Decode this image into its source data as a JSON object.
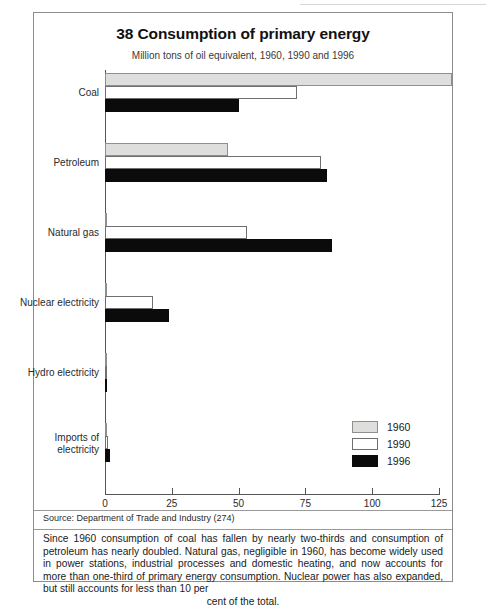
{
  "figure": {
    "title": "38 Consumption of primary energy",
    "subtitle": "Million tons of oil equivalent, 1960, 1990 and 1996",
    "source": "Source: Department of Trade and Industry (274)",
    "note": "Since 1960 consumption of coal has fallen by nearly two-thirds and consumption of petroleum has nearly doubled. Natural gas, negligible in 1960, has become widely used in power stations, industrial processes and domestic heating, and now accounts for more than one-third of primary energy consumption. Nuclear power has also expanded, but still accounts for less than 10 per",
    "note_last_line": "cent of the total."
  },
  "legend": {
    "position": "bottom-right",
    "entries": [
      {
        "label": "1960",
        "color": "#dededc"
      },
      {
        "label": "1990",
        "color": "#ffffff"
      },
      {
        "label": "1996",
        "color": "#0b0b0b"
      }
    ]
  },
  "chart_data": {
    "type": "bar",
    "orientation": "horizontal",
    "title": "38 Consumption of primary energy",
    "subtitle": "Million tons of oil equivalent, 1960, 1990 and 1996",
    "xlabel": "",
    "ylabel": "",
    "xlim": [
      0,
      125
    ],
    "xticks": [
      0,
      25,
      50,
      75,
      100,
      125
    ],
    "xtick_labels": [
      "0",
      "25",
      "50",
      "75",
      "100",
      "125"
    ],
    "grid": false,
    "categories": [
      "Coal",
      "Petroleum",
      "Natural gas",
      "Nuclear electricity",
      "Hydro electricity",
      "Imports of\nelectricity"
    ],
    "series": [
      {
        "name": "1960",
        "color": "#dededc",
        "values": [
          130,
          46,
          0,
          0,
          0.5,
          0
        ]
      },
      {
        "name": "1990",
        "color": "#ffffff",
        "values": [
          72,
          81,
          53,
          18,
          0.5,
          1
        ]
      },
      {
        "name": "1996",
        "color": "#0b0b0b",
        "values": [
          50,
          83,
          85,
          24,
          0.5,
          2
        ]
      }
    ]
  }
}
